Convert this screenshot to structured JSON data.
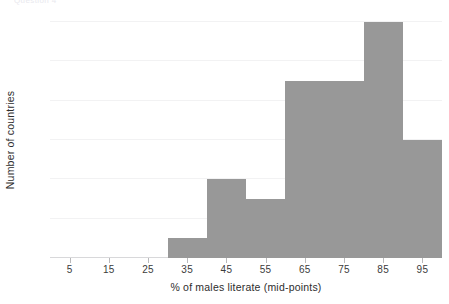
{
  "figure": {
    "top_strip_text": "Question 4",
    "bar_color": "#989898",
    "grid_color": "#f2f2f3",
    "axis_color": "#d8d8da",
    "text_color": "#3b3b3b"
  },
  "chart_data": {
    "type": "bar",
    "chart_subtype": "histogram",
    "title": "",
    "xlabel": "% of males literate (mid-points)",
    "ylabel": "Number of countries",
    "categories": [
      35,
      45,
      55,
      65,
      75,
      85,
      95
    ],
    "values": [
      1,
      4,
      3,
      9,
      9,
      12,
      6
    ],
    "bin_edges": [
      30,
      40,
      50,
      60,
      70,
      80,
      90,
      100
    ],
    "bin_width": 10,
    "xlim": [
      0,
      100
    ],
    "ylim": [
      0,
      12
    ],
    "xticks": [
      5,
      15,
      25,
      35,
      45,
      55,
      65,
      75,
      85,
      95
    ],
    "xtick_labels": [
      "5",
      "15",
      "25",
      "35",
      "45",
      "55",
      "65",
      "75",
      "85",
      "95"
    ],
    "yticks": [
      0,
      2,
      4,
      6,
      8,
      10,
      12
    ],
    "ytick_labels": [
      "0",
      "2",
      "4",
      "6",
      "8",
      "10",
      "12"
    ],
    "grid": "horizontal",
    "legend": null,
    "bars": [
      {
        "mid_point": 35,
        "bin_start": 30,
        "bin_end": 40,
        "count": 1
      },
      {
        "mid_point": 45,
        "bin_start": 40,
        "bin_end": 50,
        "count": 4
      },
      {
        "mid_point": 55,
        "bin_start": 50,
        "bin_end": 60,
        "count": 3
      },
      {
        "mid_point": 65,
        "bin_start": 60,
        "bin_end": 70,
        "count": 9
      },
      {
        "mid_point": 75,
        "bin_start": 70,
        "bin_end": 80,
        "count": 9
      },
      {
        "mid_point": 85,
        "bin_start": 80,
        "bin_end": 90,
        "count": 12
      },
      {
        "mid_point": 95,
        "bin_start": 90,
        "bin_end": 100,
        "count": 6
      }
    ]
  }
}
